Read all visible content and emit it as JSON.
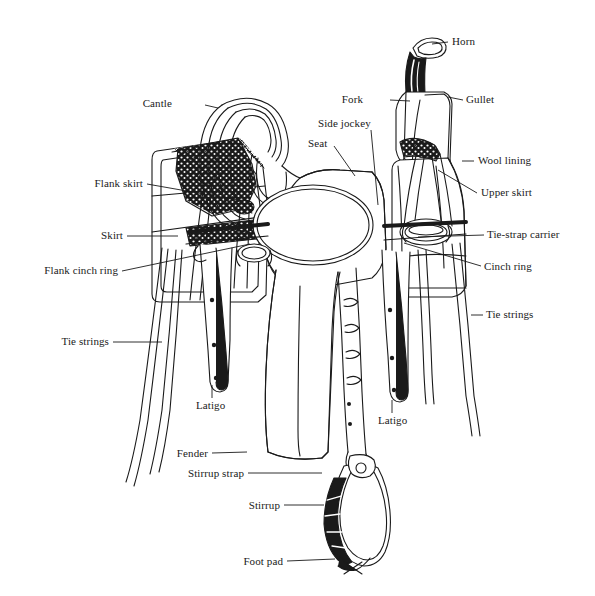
{
  "diagram": {
    "style": "black-and-white line illustration",
    "background_color": "#ffffff",
    "ink_color": "#1a1a1a",
    "labels": [
      {
        "id": "horn",
        "text": "Horn",
        "align": "left",
        "x": 452,
        "y": 36,
        "leader": [
          [
            448,
            42
          ],
          [
            432,
            44
          ]
        ]
      },
      {
        "id": "fork",
        "text": "Fork",
        "align": "right",
        "x": 363,
        "y": 94,
        "leader": [
          [
            390,
            100
          ],
          [
            410,
            101
          ]
        ]
      },
      {
        "id": "gullet",
        "text": "Gullet",
        "align": "left",
        "x": 466,
        "y": 94,
        "leader": [
          [
            463,
            100
          ],
          [
            448,
            97
          ]
        ]
      },
      {
        "id": "side-jockey",
        "text": "Side jockey",
        "align": "left",
        "x": 318,
        "y": 118,
        "leader": [
          [
            371,
            130
          ],
          [
            378,
            205
          ]
        ]
      },
      {
        "id": "seat",
        "text": "Seat",
        "align": "left",
        "x": 308,
        "y": 138,
        "leader": [
          [
            334,
            146
          ],
          [
            355,
            176
          ]
        ]
      },
      {
        "id": "cantle",
        "text": "Cantle",
        "align": "right",
        "x": 172,
        "y": 98,
        "leader": [
          [
            205,
            105
          ],
          [
            218,
            108
          ]
        ]
      },
      {
        "id": "wool-lining",
        "text": "Wool lining",
        "align": "left",
        "x": 478,
        "y": 155,
        "leader": [
          [
            474,
            161
          ],
          [
            462,
            161
          ]
        ]
      },
      {
        "id": "upper-skirt",
        "text": "Upper skirt",
        "align": "left",
        "x": 481,
        "y": 187,
        "leader": [
          [
            477,
            193
          ],
          [
            438,
            170
          ]
        ]
      },
      {
        "id": "flank-skirt",
        "text": "Flank skirt",
        "align": "right",
        "x": 143,
        "y": 178,
        "leader": [
          [
            147,
            184
          ],
          [
            238,
            200
          ]
        ]
      },
      {
        "id": "skirt",
        "text": "Skirt",
        "align": "right",
        "x": 123,
        "y": 230,
        "leader": [
          [
            127,
            236
          ],
          [
            178,
            236
          ]
        ]
      },
      {
        "id": "tie-strap-carrier",
        "text": "Tie-strap carrier",
        "align": "left",
        "x": 487,
        "y": 229,
        "leader": [
          [
            484,
            235
          ],
          [
            418,
            237
          ]
        ]
      },
      {
        "id": "cinch-ring",
        "text": "Cinch ring",
        "align": "left",
        "x": 484,
        "y": 261,
        "leader": [
          [
            481,
            266
          ],
          [
            404,
            243
          ]
        ]
      },
      {
        "id": "flank-cinch-ring",
        "text": "Flank cinch ring",
        "align": "right",
        "x": 118,
        "y": 265,
        "leader": [
          [
            122,
            271
          ],
          [
            250,
            244
          ]
        ]
      },
      {
        "id": "tie-strings-right",
        "text": "Tie strings",
        "align": "left",
        "x": 486,
        "y": 309,
        "leader": [
          [
            483,
            315
          ],
          [
            471,
            315
          ]
        ]
      },
      {
        "id": "tie-strings-left",
        "text": "Tie strings",
        "align": "right",
        "x": 109,
        "y": 336,
        "leader": [
          [
            113,
            342
          ],
          [
            162,
            342
          ]
        ]
      },
      {
        "id": "latigo-left",
        "text": "Latigo",
        "align": "left",
        "x": 196,
        "y": 400,
        "leader": [
          [
            212,
            398
          ],
          [
            212,
            385
          ]
        ]
      },
      {
        "id": "latigo-right",
        "text": "Latigo",
        "align": "left",
        "x": 378,
        "y": 415,
        "leader": [
          [
            392,
            413
          ],
          [
            392,
            400
          ]
        ]
      },
      {
        "id": "fender",
        "text": "Fender",
        "align": "right",
        "x": 208,
        "y": 448,
        "leader": [
          [
            212,
            453
          ],
          [
            247,
            452
          ]
        ]
      },
      {
        "id": "stirrup-strap",
        "text": "Stirrup strap",
        "align": "right",
        "x": 244,
        "y": 468,
        "leader": [
          [
            248,
            473
          ],
          [
            322,
            473
          ]
        ]
      },
      {
        "id": "stirrup",
        "text": "Stirrup",
        "align": "right",
        "x": 280,
        "y": 500,
        "leader": [
          [
            284,
            505
          ],
          [
            324,
            505
          ]
        ]
      },
      {
        "id": "foot-pad",
        "text": "Foot pad",
        "align": "right",
        "x": 283,
        "y": 556,
        "leader": [
          [
            287,
            561
          ],
          [
            335,
            559
          ]
        ]
      }
    ],
    "parts_legend": [
      "Horn",
      "Fork",
      "Gullet",
      "Side jockey",
      "Seat",
      "Cantle",
      "Wool lining",
      "Upper skirt",
      "Flank skirt",
      "Skirt",
      "Tie-strap carrier",
      "Cinch ring",
      "Flank cinch ring",
      "Tie strings",
      "Latigo",
      "Fender",
      "Stirrup strap",
      "Stirrup",
      "Foot pad"
    ]
  }
}
